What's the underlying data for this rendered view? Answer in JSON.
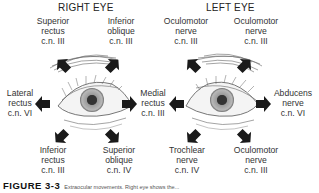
{
  "figure": {
    "right_eye": {
      "title": "RIGHT EYE",
      "labels": {
        "superior_rectus": [
          "Superior",
          "rectus",
          "c.n. III"
        ],
        "inferior_oblique": [
          "Inferior",
          "oblique",
          "c.n. III"
        ],
        "lateral_rectus": [
          "Lateral",
          "rectus",
          "c.n. VI"
        ],
        "medial_rectus": [
          "Medial",
          "rectus",
          "c.n. III"
        ],
        "inferior_rectus": [
          "Inferior",
          "rectus",
          "c.n. III"
        ],
        "superior_oblique": [
          "Superior",
          "oblique",
          "c.n. IV"
        ]
      }
    },
    "left_eye": {
      "title": "LEFT EYE",
      "labels": {
        "oculomotor_upper_left": [
          "Oculomotor",
          "nerve",
          "c.n. III"
        ],
        "oculomotor_upper_right": [
          "Oculomotor",
          "nerve",
          "c.n. III"
        ],
        "abducens": [
          "Abducens",
          "nerve",
          "c.n. VI"
        ],
        "trochlear": [
          "Trochlear",
          "nerve",
          "c.n. IV"
        ],
        "oculomotor_lower_right": [
          "Oculomotor",
          "nerve",
          "c.n. III"
        ]
      }
    },
    "caption": {
      "label": "FIGURE 3-3",
      "text": "Extraocular movements. Right eye shows the..."
    },
    "colors": {
      "arrow": "#1a1a1a",
      "iris": "#8a8a8a",
      "pupil": "#3a3a3a",
      "line": "#555555"
    }
  }
}
